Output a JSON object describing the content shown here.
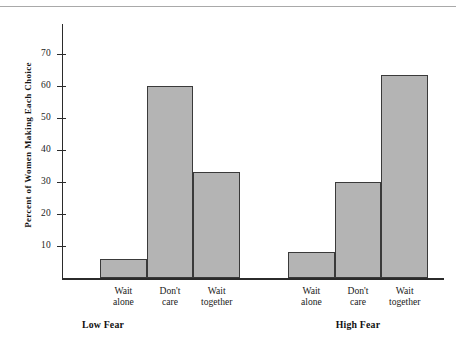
{
  "chart_data": {
    "type": "bar",
    "title": "",
    "xlabel": "",
    "ylabel": "Percent of Women Making Each Choice",
    "ylim": [
      0,
      78
    ],
    "yticks": [
      10,
      20,
      30,
      40,
      50,
      60,
      70
    ],
    "ytick_labels": [
      "10",
      "20",
      "30",
      "40",
      "50",
      "60",
      "70"
    ],
    "grid": false,
    "legend": null,
    "bar_color": "#b4b4b4",
    "bar_edge_color": "#3a3a3a",
    "groups": [
      {
        "name": "Low Fear",
        "categories": [
          "Wait alone",
          "Don't care",
          "Wait together"
        ],
        "values": [
          6,
          60,
          33
        ]
      },
      {
        "name": "High Fear",
        "categories": [
          "Wait alone",
          "Don't care",
          "Wait together"
        ],
        "values": [
          8,
          30,
          63.5
        ]
      }
    ],
    "categories": [
      "Wait alone",
      "Don't care",
      "Wait together",
      "Wait alone",
      "Don't care",
      "Wait together"
    ],
    "values": [
      6,
      60,
      33,
      8,
      30,
      63.5
    ],
    "bars": [
      {
        "label_line1": "Wait",
        "label_line2": "alone",
        "group": "Low Fear",
        "value": 6
      },
      {
        "label_line1": "Don't",
        "label_line2": "care",
        "group": "Low Fear",
        "value": 60
      },
      {
        "label_line1": "Wait",
        "label_line2": "together",
        "group": "Low Fear",
        "value": 33
      },
      {
        "label_line1": "Wait",
        "label_line2": "alone",
        "group": "High Fear",
        "value": 8
      },
      {
        "label_line1": "Don't",
        "label_line2": "care",
        "group": "High Fear",
        "value": 30
      },
      {
        "label_line1": "Wait",
        "label_line2": "together",
        "group": "High Fear",
        "value": 63.5
      }
    ]
  }
}
